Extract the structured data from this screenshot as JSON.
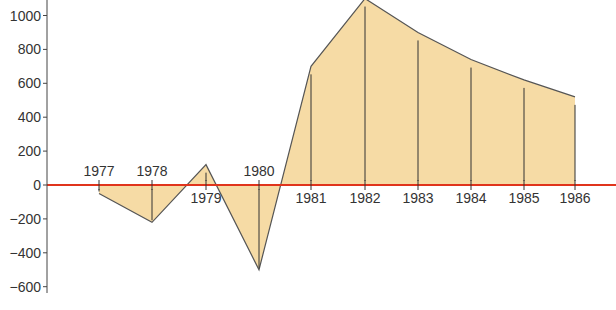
{
  "chart_data": {
    "type": "area",
    "title": "",
    "xlabel": "",
    "ylabel": "",
    "categories": [
      "1977",
      "1978",
      "1979",
      "1980",
      "1981",
      "1982",
      "1983",
      "1984",
      "1985",
      "1986"
    ],
    "values": [
      -50,
      -220,
      120,
      -500,
      700,
      1100,
      900,
      740,
      620,
      520
    ],
    "ylim": [
      -650,
      1100
    ],
    "yticks": [
      1000,
      800,
      600,
      400,
      200,
      0,
      -200,
      -400,
      -600
    ],
    "ytick_labels": [
      "1000",
      "800",
      "600",
      "400",
      "200",
      "0",
      "−200",
      "−400",
      "−600"
    ],
    "label_position": [
      "above",
      "above",
      "below",
      "above",
      "below",
      "below",
      "below",
      "below",
      "below",
      "below"
    ],
    "grid": false,
    "legend": null,
    "colors": {
      "fill": "#f6dba5",
      "outline": "#555555",
      "zero_line": "#e0341c",
      "axis": "#444444",
      "drops": "#333333"
    }
  }
}
